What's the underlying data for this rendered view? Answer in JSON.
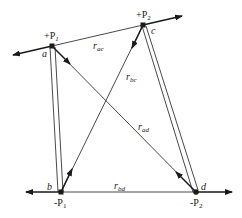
{
  "diagram": {
    "type": "force/charge diagram",
    "colors": {
      "line": "#1a1a1a",
      "background": "#ffffff"
    },
    "points": {
      "a": {
        "label": "a",
        "charge_label": "+P",
        "charge_sub": "1",
        "x": 52,
        "y": 46
      },
      "c": {
        "label": "c",
        "charge_label": "+P",
        "charge_sub": "2",
        "x": 143,
        "y": 25
      },
      "b": {
        "label": "b",
        "charge_label": "-P",
        "charge_sub": "1",
        "x": 61,
        "y": 192
      },
      "d": {
        "label": "d",
        "charge_label": "-P",
        "charge_sub": "2",
        "x": 196,
        "y": 192
      }
    },
    "distances": {
      "ac": {
        "r": "r",
        "sub": "ac"
      },
      "bc": {
        "r": "r",
        "sub": "bc"
      },
      "ad": {
        "r": "r",
        "sub": "ad"
      },
      "bd": {
        "r": "r",
        "sub": "bd"
      }
    }
  }
}
